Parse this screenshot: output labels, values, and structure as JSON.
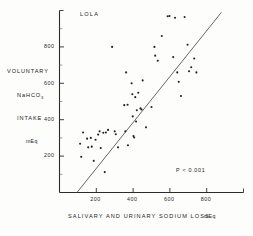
{
  "figure": {
    "panel_label": "LOLA",
    "annotation": "P < 0.001",
    "background_color": "#fdfdfb",
    "ink_color": "#232323"
  },
  "axes": {
    "y": {
      "title_lines": [
        "VOLUNTARY",
        "NaHCO",
        "INTAKE",
        "mEq"
      ],
      "title_line_1": "VOLUNTARY",
      "title_line_2_base": "NaHCO",
      "title_line_2_sub": "3",
      "title_line_3": "INTAKE",
      "unit": "mEq",
      "tick_labels": [
        "200",
        "400",
        "600",
        "800"
      ],
      "tick_values": [
        200,
        400,
        600,
        800
      ],
      "range": [
        0,
        1000
      ]
    },
    "x": {
      "caption": "SALIVARY  AND  URINARY  SODIUM  LOSS",
      "unit": "mEq",
      "tick_labels": [
        "200",
        "400",
        "600",
        "800"
      ],
      "tick_values": [
        200,
        400,
        600,
        800
      ],
      "range": [
        0,
        1000
      ]
    }
  },
  "chart_data": {
    "type": "scatter",
    "title": "LOLA",
    "xlabel": "SALIVARY AND URINARY SODIUM LOSS (mEq)",
    "ylabel": "VOLUNTARY NaHCO3 INTAKE (mEq)",
    "xlim": [
      0,
      1000
    ],
    "ylim": [
      0,
      1000
    ],
    "xticks": [
      200,
      400,
      600,
      800
    ],
    "yticks": [
      200,
      400,
      600,
      800
    ],
    "grid": false,
    "legend": null,
    "annotations": [
      {
        "text": "LOLA",
        "x": 120,
        "y": 940
      },
      {
        "text": "P < 0.001",
        "x": 700,
        "y": 120
      }
    ],
    "regression_line": {
      "x": [
        95,
        880
      ],
      "y": [
        0,
        990
      ],
      "comment": "least-squares fit drawn across plot"
    },
    "points": [
      {
        "x": 112,
        "y": 268
      },
      {
        "x": 118,
        "y": 196
      },
      {
        "x": 128,
        "y": 330
      },
      {
        "x": 150,
        "y": 296
      },
      {
        "x": 156,
        "y": 248
      },
      {
        "x": 170,
        "y": 300
      },
      {
        "x": 175,
        "y": 252
      },
      {
        "x": 186,
        "y": 174
      },
      {
        "x": 196,
        "y": 290
      },
      {
        "x": 210,
        "y": 318
      },
      {
        "x": 218,
        "y": 336
      },
      {
        "x": 224,
        "y": 244
      },
      {
        "x": 238,
        "y": 328
      },
      {
        "x": 246,
        "y": 112
      },
      {
        "x": 252,
        "y": 330
      },
      {
        "x": 264,
        "y": 344
      },
      {
        "x": 286,
        "y": 800
      },
      {
        "x": 300,
        "y": 336
      },
      {
        "x": 306,
        "y": 320
      },
      {
        "x": 318,
        "y": 248
      },
      {
        "x": 352,
        "y": 480
      },
      {
        "x": 358,
        "y": 336
      },
      {
        "x": 362,
        "y": 660
      },
      {
        "x": 370,
        "y": 482
      },
      {
        "x": 372,
        "y": 260
      },
      {
        "x": 392,
        "y": 600
      },
      {
        "x": 396,
        "y": 540
      },
      {
        "x": 398,
        "y": 418
      },
      {
        "x": 402,
        "y": 310
      },
      {
        "x": 406,
        "y": 302
      },
      {
        "x": 412,
        "y": 524
      },
      {
        "x": 416,
        "y": 390
      },
      {
        "x": 420,
        "y": 452
      },
      {
        "x": 428,
        "y": 548
      },
      {
        "x": 440,
        "y": 462
      },
      {
        "x": 446,
        "y": 456
      },
      {
        "x": 452,
        "y": 616
      },
      {
        "x": 470,
        "y": 358
      },
      {
        "x": 500,
        "y": 470
      },
      {
        "x": 516,
        "y": 800
      },
      {
        "x": 520,
        "y": 752
      },
      {
        "x": 534,
        "y": 724
      },
      {
        "x": 556,
        "y": 860
      },
      {
        "x": 588,
        "y": 968
      },
      {
        "x": 598,
        "y": 970
      },
      {
        "x": 618,
        "y": 744
      },
      {
        "x": 628,
        "y": 960
      },
      {
        "x": 640,
        "y": 660
      },
      {
        "x": 648,
        "y": 608
      },
      {
        "x": 660,
        "y": 530
      },
      {
        "x": 680,
        "y": 964
      },
      {
        "x": 696,
        "y": 812
      },
      {
        "x": 704,
        "y": 666
      },
      {
        "x": 716,
        "y": 688
      },
      {
        "x": 732,
        "y": 736
      },
      {
        "x": 744,
        "y": 660
      }
    ]
  }
}
